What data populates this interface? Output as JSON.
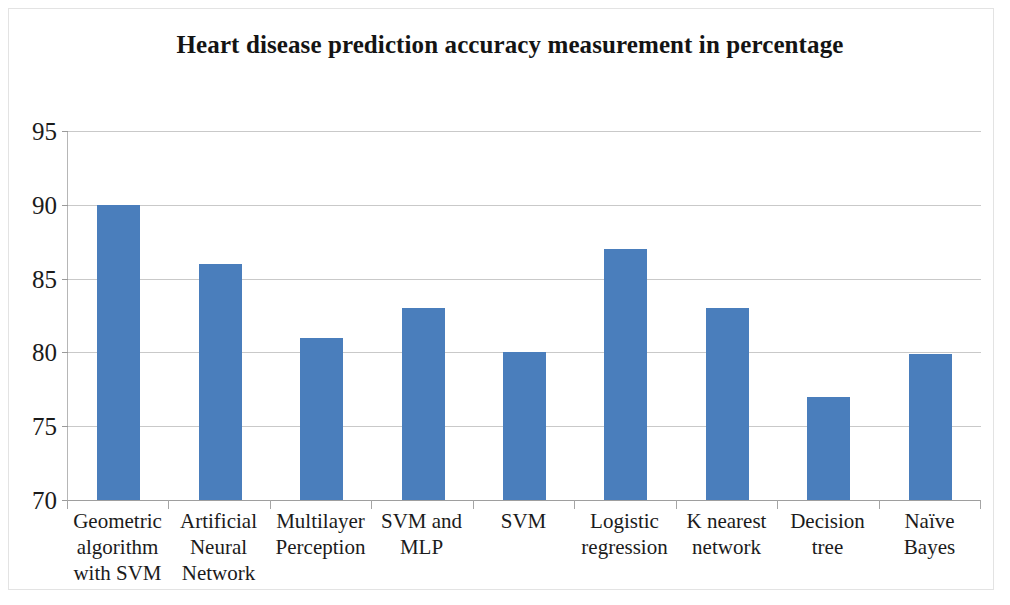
{
  "chart_data": {
    "type": "bar",
    "title": "Heart disease prediction accuracy measurement in percentage",
    "xlabel": "",
    "ylabel": "",
    "ylim": [
      70,
      95
    ],
    "ytick_labels": [
      "95",
      "90",
      "85",
      "80",
      "75",
      "70"
    ],
    "yticks": [
      95,
      90,
      85,
      80,
      75,
      70
    ],
    "grid": true,
    "legend": "none",
    "bar_color": "#4a7ebc",
    "categories": [
      "Geometric algorithm with SVM",
      "Artificial Neural Network",
      "Multilayer Perception",
      "SVM and MLP",
      "SVM",
      "Logistic regression",
      "K nearest network",
      "Decision tree",
      "Naïve Bayes"
    ],
    "category_label_lines": [
      [
        "Geometric",
        "algorithm",
        "with SVM"
      ],
      [
        "Artificial",
        "Neural",
        "Network"
      ],
      [
        "Multilayer",
        "Perception"
      ],
      [
        "SVM and",
        "MLP"
      ],
      [
        "SVM"
      ],
      [
        "Logistic",
        "regression"
      ],
      [
        "K nearest",
        "network"
      ],
      [
        "Decision",
        "tree"
      ],
      [
        "Naïve",
        "Bayes"
      ]
    ],
    "values": [
      90,
      86,
      81,
      83,
      80,
      87,
      83,
      77,
      79.9
    ],
    "series": [
      {
        "name": "Accuracy (%)",
        "values": [
          90,
          86,
          81,
          83,
          80,
          87,
          83,
          77,
          79.9
        ]
      }
    ]
  }
}
